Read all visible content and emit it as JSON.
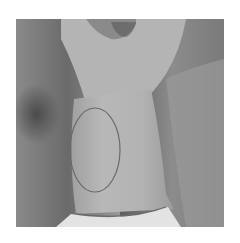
{
  "figure": {
    "mode": "grayscale",
    "annotation": {
      "shape": "ellipse",
      "stroke": "#6a6a6a",
      "cx": 79,
      "cy": 131,
      "rx": 25,
      "ry": 42
    },
    "colors": {
      "background": "#ffffff",
      "skin_light": "#bdbdbd",
      "skin_mid": "#a8a8a8",
      "shadow": "#5e5e5e",
      "sleeve": "#e3e3e3"
    }
  }
}
